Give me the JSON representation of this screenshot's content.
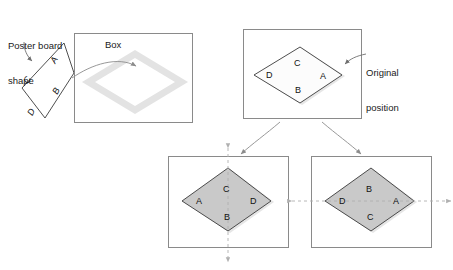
{
  "figure": {
    "title_hidden": "",
    "colors": {
      "panel_border": "#8a8a8a",
      "shape_stroke": "#3a3a3a",
      "shape_fill_gray": "#c9c9c9",
      "shape_fill_white": "#ffffff",
      "shadow": "#e2e2e2",
      "slot_outline": "#e0e0e0",
      "arrow": "#8c8c8c",
      "dashed_axis": "#b0b0b0",
      "text": "#1a1a1a"
    }
  },
  "annotations": {
    "poster_board": {
      "line1": "Poster board",
      "line2": "shape",
      "name": "poster-board-shape-label"
    },
    "box": {
      "text": "Box",
      "name": "box-label"
    },
    "original_position": {
      "line1": "Original",
      "line2": "position",
      "name": "original-position-label"
    }
  },
  "shapes": {
    "poster_board": {
      "name": "poster-board-quadrilateral",
      "description": "tilted quadrilateral outside the box",
      "corner_labels": [
        "A",
        "B",
        "C",
        "D"
      ],
      "label_rotation_deg": -62,
      "edge_labels": {
        "A": "A",
        "B": "B",
        "C": "C",
        "D": "D"
      }
    },
    "box_slot": {
      "name": "box-empty-diamond-slot",
      "filled": false
    },
    "original_position": {
      "name": "diamond-original-position",
      "fill": "white",
      "edge_labels": {
        "top": "C",
        "left": "D",
        "right": "A",
        "bottom": "B"
      }
    },
    "vertical_flip_result": {
      "name": "diamond-flipped-over-vertical-axis",
      "fill": "gray",
      "axis": "vertical",
      "edge_labels": {
        "top": "C",
        "left": "A",
        "right": "D",
        "bottom": "B"
      }
    },
    "horizontal_flip_result": {
      "name": "diamond-flipped-over-horizontal-axis",
      "fill": "gray",
      "axis": "horizontal",
      "edge_labels": {
        "top": "B",
        "left": "D",
        "right": "A",
        "bottom": "C"
      }
    }
  },
  "panels": [
    {
      "id": "box-panel",
      "label": "Box"
    },
    {
      "id": "original-panel",
      "label": "Original position"
    },
    {
      "id": "vertical-flip-panel",
      "label": ""
    },
    {
      "id": "horizontal-flip-panel",
      "label": ""
    }
  ]
}
